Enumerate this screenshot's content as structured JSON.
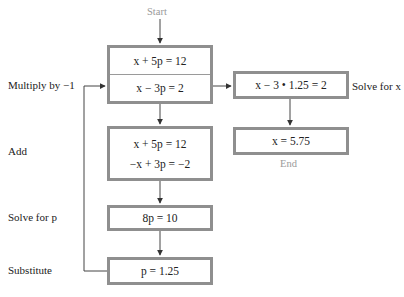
{
  "diagram": {
    "start_label": "Start",
    "end_label": "End",
    "boxes": {
      "system": {
        "line1": "x + 5p = 12",
        "line2": "x − 3p =  2"
      },
      "add": {
        "line1": "x + 5p = 12",
        "line2": "−x + 3p = −2"
      },
      "solve_p": {
        "line1": "8p = 10"
      },
      "substitute": {
        "line1": "p = 1.25"
      },
      "back_sub": {
        "line1": "x − 3 • 1.25 = 2"
      },
      "result": {
        "line1": "x = 5.75"
      }
    },
    "step_labels": {
      "multiply": "Multiply by −1",
      "add": "Add",
      "solve_p": "Solve for p",
      "substitute": "Substitute",
      "solve_x": "Solve for x"
    },
    "colors": {
      "box_border": "#8f8f8f",
      "line": "#333333",
      "muted_text": "#9a9a9a"
    }
  }
}
